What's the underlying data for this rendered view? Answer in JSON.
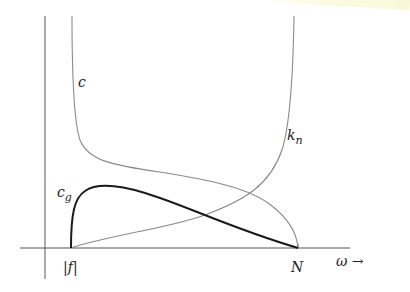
{
  "diagram": {
    "title": "",
    "labels": {
      "c": "c",
      "cg_base": "c",
      "cg_sub": "g",
      "kn_base": "k",
      "kn_sub": "n",
      "f_tick": "|f|",
      "N_tick": "N",
      "x_axis": "ω →"
    },
    "colors": {
      "axis": "#555555",
      "thin_curve": "#8a8a8a",
      "thick_curve": "#1a1a1a"
    },
    "curves": [
      {
        "name": "c",
        "description": "phase speed, infinite at |f|, decreasing to N"
      },
      {
        "name": "c_g",
        "description": "group speed, zero at |f| and N, peak near low ω"
      },
      {
        "name": "k_n",
        "description": "wavenumber, zero at |f|, infinite at N"
      }
    ]
  }
}
